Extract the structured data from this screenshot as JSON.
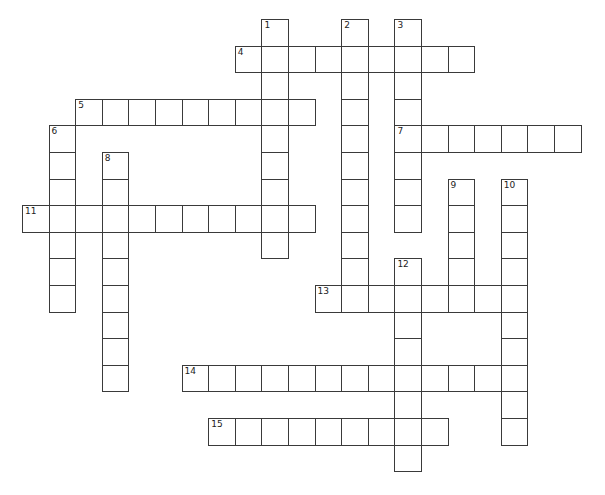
{
  "puzzle": {
    "type": "crossword",
    "cell_size": 26.6,
    "origin_x": 22,
    "origin_y": 19,
    "rows": 17,
    "cols": 22,
    "border_color": "#3a3a3a",
    "cell_fill": "#ffffff",
    "entries": [
      {
        "number": "1",
        "direction": "down",
        "row": 0,
        "col": 9,
        "length": 9
      },
      {
        "number": "2",
        "direction": "down",
        "row": 0,
        "col": 12,
        "length": 11
      },
      {
        "number": "3",
        "direction": "down",
        "row": 0,
        "col": 14,
        "length": 8
      },
      {
        "number": "4",
        "direction": "across",
        "row": 1,
        "col": 8,
        "length": 9
      },
      {
        "number": "5",
        "direction": "across",
        "row": 3,
        "col": 2,
        "length": 9
      },
      {
        "number": "6",
        "direction": "down",
        "row": 4,
        "col": 1,
        "length": 7
      },
      {
        "number": "7",
        "direction": "across",
        "row": 4,
        "col": 14,
        "length": 7
      },
      {
        "number": "8",
        "direction": "down",
        "row": 5,
        "col": 3,
        "length": 9
      },
      {
        "number": "9",
        "direction": "down",
        "row": 6,
        "col": 16,
        "length": 5
      },
      {
        "number": "10",
        "direction": "down",
        "row": 6,
        "col": 18,
        "length": 10
      },
      {
        "number": "11",
        "direction": "across",
        "row": 7,
        "col": 0,
        "length": 11
      },
      {
        "number": "12",
        "direction": "down",
        "row": 9,
        "col": 14,
        "length": 8
      },
      {
        "number": "13",
        "direction": "across",
        "row": 10,
        "col": 11,
        "length": 8
      },
      {
        "number": "14",
        "direction": "across",
        "row": 13,
        "col": 6,
        "length": 12
      },
      {
        "number": "15",
        "direction": "across",
        "row": 15,
        "col": 7,
        "length": 9
      }
    ]
  }
}
